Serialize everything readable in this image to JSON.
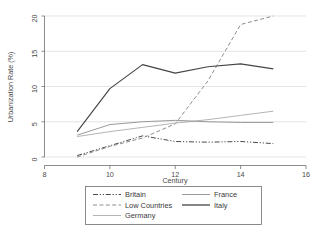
{
  "chart_data": {
    "type": "line",
    "title": "",
    "xlabel": "Century",
    "ylabel": "Urbanization Rate (%)",
    "xlim": [
      8,
      16
    ],
    "ylim": [
      0,
      20
    ],
    "xticks": [
      8,
      10,
      12,
      14,
      16
    ],
    "yticks": [
      0,
      5,
      10,
      15,
      20
    ],
    "xticklabels": [
      "8",
      "10",
      "12",
      "14",
      "16"
    ],
    "yticklabels": [
      "0",
      "5",
      "10",
      "15",
      "20"
    ],
    "grid": "horizontal",
    "legend_position": "below-axes",
    "series": [
      {
        "name": "Britain",
        "style": "dash-dot-dot",
        "color": "#4a4a4a",
        "x": [
          9,
          10,
          11,
          12,
          13,
          14,
          15
        ],
        "values": [
          0.2,
          1.6,
          3.0,
          2.2,
          2.1,
          2.2,
          1.9
        ]
      },
      {
        "name": "Low Countries",
        "style": "dashed",
        "color": "#8e8e8e",
        "x": [
          9,
          10,
          11,
          12,
          13,
          14,
          15
        ],
        "values": [
          0.0,
          1.5,
          2.7,
          4.7,
          10.8,
          18.8,
          20.0
        ]
      },
      {
        "name": "Germany",
        "style": "solid",
        "color": "#b4b4b4",
        "x": [
          9,
          10,
          11,
          12,
          13,
          14,
          15
        ],
        "values": [
          2.9,
          3.6,
          4.2,
          4.8,
          5.3,
          5.9,
          6.5
        ]
      },
      {
        "name": "France",
        "style": "solid",
        "color": "#9a9a9a",
        "x": [
          9,
          10,
          11,
          12,
          13,
          14,
          15
        ],
        "values": [
          3.1,
          4.6,
          5.0,
          5.2,
          5.0,
          4.9,
          4.9
        ]
      },
      {
        "name": "Italy",
        "style": "solid",
        "color": "#454545",
        "x": [
          9,
          10,
          11,
          12,
          13,
          14,
          15
        ],
        "values": [
          3.6,
          9.7,
          13.1,
          11.9,
          12.8,
          13.2,
          12.5
        ]
      }
    ]
  },
  "legend": {
    "entries": [
      {
        "label": "Britain",
        "series": "Britain"
      },
      {
        "label": "Low Countries",
        "series": "Low Countries"
      },
      {
        "label": "Germany",
        "series": "Germany"
      },
      {
        "label": "France",
        "series": "France"
      },
      {
        "label": "Italy",
        "series": "Italy"
      }
    ]
  }
}
